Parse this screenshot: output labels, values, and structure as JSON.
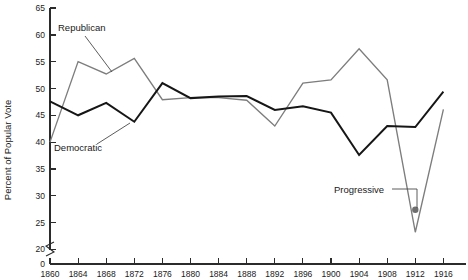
{
  "chart_data": {
    "type": "line",
    "title": "",
    "xlabel": "",
    "ylabel": "Percent of Popular Vote",
    "xlim": [
      1860,
      1916
    ],
    "ylim": [
      20,
      65
    ],
    "y_axis_break": true,
    "y_break_label": "0",
    "grid": false,
    "legend": "annotations",
    "x": [
      1860,
      1864,
      1868,
      1872,
      1876,
      1880,
      1884,
      1888,
      1892,
      1896,
      1900,
      1904,
      1908,
      1912,
      1916
    ],
    "xticks": [
      "1860",
      "1864",
      "1868",
      "1872",
      "1876",
      "1880",
      "1884",
      "1888",
      "1892",
      "1896",
      "1900",
      "1904",
      "1908",
      "1912",
      "1916"
    ],
    "yticks": [
      "0",
      "20",
      "25",
      "30",
      "35",
      "40",
      "45",
      "50",
      "55",
      "60",
      "65"
    ],
    "series": [
      {
        "name": "Republican",
        "color": "#7d7d7d",
        "values": [
          40.0,
          55.0,
          52.7,
          55.6,
          47.9,
          48.3,
          48.3,
          47.8,
          43.0,
          51.0,
          51.6,
          57.4,
          51.6,
          23.2,
          46.1
        ]
      },
      {
        "name": "Democratic",
        "color": "#161616",
        "values": [
          47.6,
          45.0,
          47.3,
          43.8,
          51.0,
          48.2,
          48.5,
          48.6,
          46.0,
          46.7,
          45.5,
          37.6,
          43.0,
          42.8,
          49.4
        ]
      }
    ],
    "points": [
      {
        "name": "Progressive",
        "x": 1912,
        "y": 27.4,
        "color": "#6e6e6e"
      }
    ],
    "annotations": [
      {
        "label": "Republican",
        "target_x": 1868,
        "target_y": 52.7
      },
      {
        "label": "Democratic",
        "target_x": 1872,
        "target_y": 43.8
      },
      {
        "label": "Progressive",
        "target_x": 1912,
        "target_y": 27.4
      }
    ]
  }
}
